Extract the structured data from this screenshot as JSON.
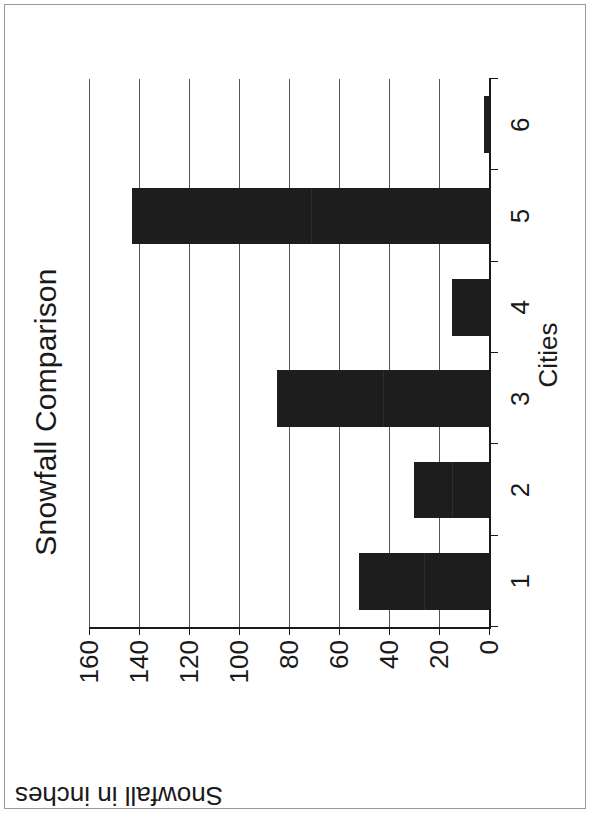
{
  "chart_data": {
    "type": "bar",
    "title": "Snowfall Comparison",
    "xlabel": "Cities",
    "ylabel": "Snowfall in inches",
    "categories": [
      "1",
      "2",
      "3",
      "4",
      "5",
      "6"
    ],
    "values": [
      52,
      30,
      85,
      15,
      143,
      2
    ],
    "series": [
      {
        "name": "Snowfall",
        "values": [
          52,
          30,
          85,
          15,
          143,
          2
        ]
      }
    ],
    "ylim": [
      0,
      160
    ],
    "ytick_labels": [
      "0",
      "20",
      "40",
      "60",
      "80",
      "100",
      "120",
      "140",
      "160"
    ],
    "ytick_values": [
      0,
      20,
      40,
      60,
      80,
      100,
      120,
      140,
      160
    ],
    "xtick_labels": [
      "1",
      "2",
      "3",
      "4",
      "5",
      "6"
    ],
    "grid": "horizontal",
    "legend": "none",
    "bar_color": "#1d1d1d",
    "axis_color": "#1a1a1a",
    "grid_color": "#555555",
    "background": "#ffffff",
    "orientation": "vertical-bars-rotated-90ccw"
  }
}
